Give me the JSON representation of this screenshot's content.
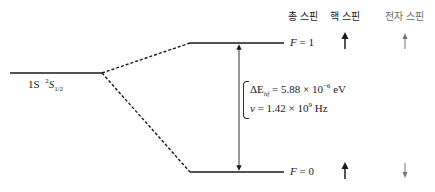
{
  "headers": {
    "total_spin": "총 스핀",
    "nuclear_spin": "핵 스핀",
    "electron_spin": "전자 스핀"
  },
  "levels": {
    "ground": {
      "n": "1S",
      "term_pre": "2",
      "term_main": "S",
      "term_sub": "1/2"
    },
    "upper": {
      "label_var": "F",
      "label_eq": " = 1"
    },
    "lower": {
      "label_var": "F",
      "label_eq": " = 0"
    }
  },
  "splitting": {
    "energy_symbol": "ΔE",
    "energy_sub": "hf",
    "energy_eq": " = 5.88 × 10",
    "energy_exp": "−6",
    "energy_unit": " eV",
    "freq_symbol": "ν",
    "freq_eq": " = 1.42 × 10",
    "freq_exp": "9",
    "freq_unit": " Hz"
  },
  "spins": {
    "upper": {
      "nuclear": "up",
      "electron": "up"
    },
    "lower": {
      "nuclear": "up",
      "electron": "down"
    }
  },
  "colors": {
    "line": "#1a1a1a",
    "electron_arrow": "#777777"
  }
}
